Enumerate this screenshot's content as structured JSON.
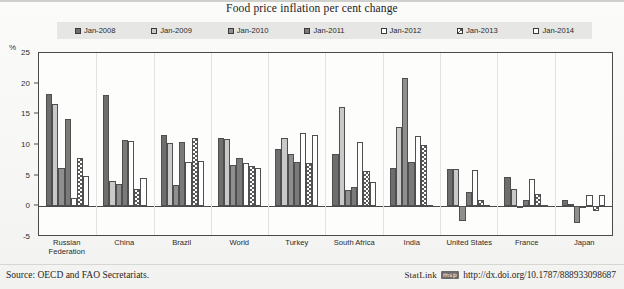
{
  "title": "Food price inflation per cent change",
  "footer": {
    "source": "Source: OECD and FAO Secretariats.",
    "statlink_word": "StatLink",
    "statlink_glyph": "msp",
    "statlink_url": "http://dx.doi.org/10.1787/888933098687"
  },
  "axis": {
    "unit": "%",
    "ticks": [
      "25",
      "20",
      "15",
      "10",
      "5",
      "0",
      "-5"
    ]
  },
  "chart_data": {
    "type": "bar",
    "title": "Food price inflation per cent change",
    "xlabel": "",
    "ylabel": "%",
    "ylim": [
      -5,
      25
    ],
    "yticks": [
      -5,
      0,
      5,
      10,
      15,
      20,
      25
    ],
    "grid": false,
    "legend_position": "top",
    "categories": [
      "Russian Federation",
      "China",
      "Brazil",
      "World",
      "Turkey",
      "South Africa",
      "India",
      "United States",
      "France",
      "Japan"
    ],
    "series": [
      {
        "name": "Jan-2008",
        "fill": "f-dark",
        "values": [
          18.3,
          18.2,
          11.6,
          11.1,
          9.3,
          8.6,
          6.3,
          6.1,
          4.8,
          1.1
        ]
      },
      {
        "name": "Jan-2009",
        "fill": "f-light",
        "values": [
          16.7,
          4.2,
          10.4,
          11.0,
          11.2,
          16.2,
          13.0,
          6.1,
          2.8,
          0.3
        ]
      },
      {
        "name": "Jan-2010",
        "fill": "f-mid",
        "values": [
          6.3,
          3.6,
          3.4,
          6.8,
          8.5,
          2.6,
          21.0,
          -2.4,
          -0.3,
          -2.7
        ]
      },
      {
        "name": "Jan-2011",
        "fill": "f-dark2",
        "values": [
          14.2,
          10.8,
          10.5,
          7.8,
          7.2,
          3.2,
          7.3,
          2.4,
          1.1,
          0.1
        ]
      },
      {
        "name": "Jan-2012",
        "fill": "f-white",
        "values": [
          1.3,
          10.6,
          7.3,
          7.0,
          11.9,
          10.5,
          11.5,
          6.0,
          4.5,
          1.9
        ]
      },
      {
        "name": "Jan-2013",
        "fill": "f-check",
        "values": [
          7.8,
          2.9,
          11.1,
          6.6,
          7.1,
          5.8,
          10.0,
          1.1,
          2.0,
          -0.8
        ]
      },
      {
        "name": "Jan-2014",
        "fill": "f-openw",
        "values": [
          5.0,
          4.6,
          7.4,
          6.2,
          11.6,
          4.0,
          0.2,
          0.2,
          0.2,
          1.8
        ]
      }
    ]
  }
}
